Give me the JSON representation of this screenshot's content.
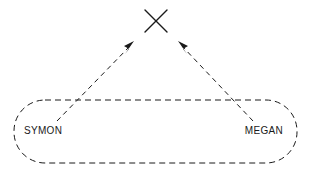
{
  "diagram": {
    "type": "dashed-arrow-diagram",
    "background_color": "#ffffff",
    "stroke_color": "#1a1a1a",
    "target": {
      "name": "x-marker",
      "symbol": "X",
      "center_x": 156,
      "center_y": 21,
      "size": 23
    },
    "group": {
      "name": "dashed-container",
      "shape": "stadium",
      "x": 14,
      "y": 100,
      "width": 283,
      "height": 63,
      "corner_radius": 31,
      "dash_pattern": "6,4"
    },
    "nodes": [
      {
        "id": "symon",
        "label": "SYMON",
        "x": 43,
        "y": 131
      },
      {
        "id": "megan",
        "label": "MEGAN",
        "x": 262,
        "y": 131
      }
    ],
    "arrows": [
      {
        "id": "symon-to-x",
        "from": "symon",
        "to": "x-marker",
        "x1": 57,
        "y1": 121,
        "x2": 133,
        "y2": 43,
        "style": "dashed",
        "dash_pattern": "5,4",
        "arrowhead": "filled-triangle"
      },
      {
        "id": "megan-to-x",
        "from": "megan",
        "to": "x-marker",
        "x1": 253,
        "y1": 121,
        "x2": 179,
        "y2": 43,
        "style": "dashed",
        "dash_pattern": "5,4",
        "arrowhead": "filled-triangle"
      }
    ]
  }
}
